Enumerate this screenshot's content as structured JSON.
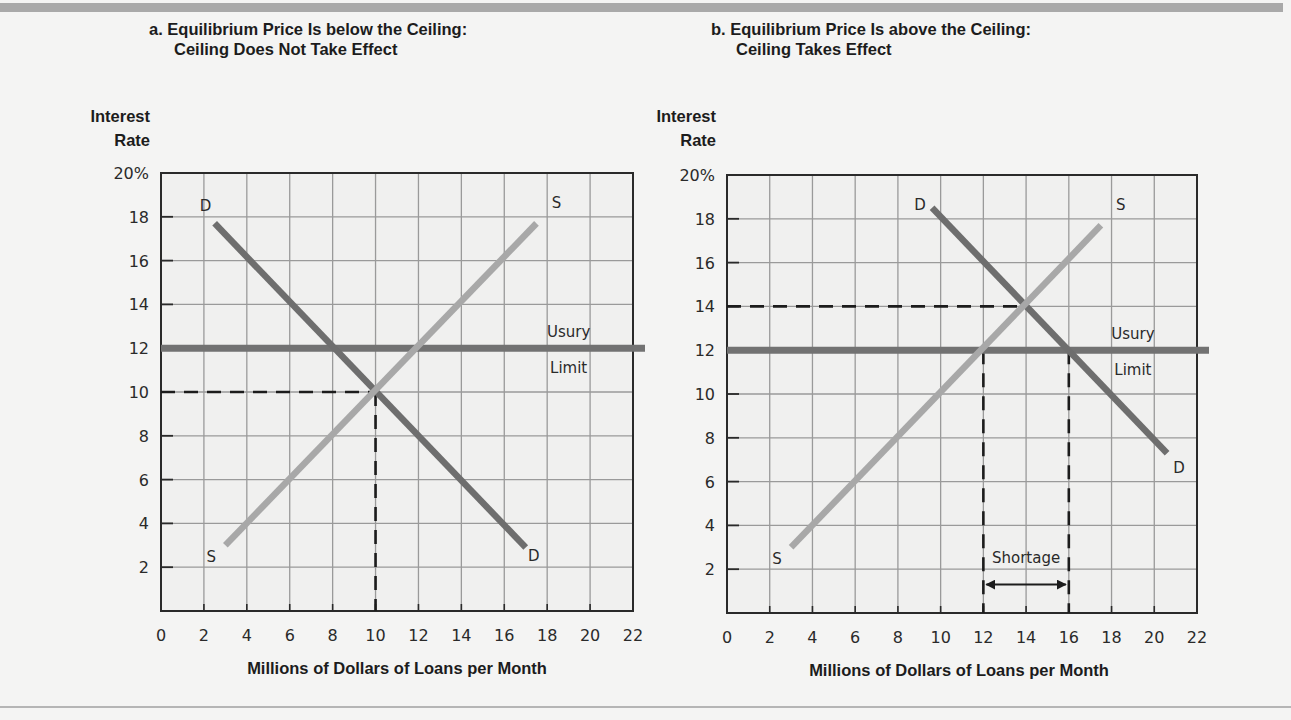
{
  "chart_data": [
    {
      "type": "line",
      "panel": "a",
      "title_line1": "a. Equilibrium Price Is below the Ceiling:",
      "title_line2": "Ceiling Does Not Take Effect",
      "ylabel_line1": "Interest",
      "ylabel_line2": "Rate",
      "xlabel": "Millions of Dollars of Loans per Month",
      "xlim": [
        0,
        22
      ],
      "ylim": [
        0,
        20
      ],
      "x_ticks": [
        0,
        2,
        4,
        6,
        8,
        10,
        12,
        14,
        16,
        18,
        20,
        22
      ],
      "x_tick_labels": [
        "0",
        "2",
        "4",
        "6",
        "8",
        "10",
        "12",
        "14",
        "16",
        "18",
        "20",
        "22"
      ],
      "y_ticks": [
        2,
        4,
        6,
        8,
        10,
        12,
        14,
        16,
        18,
        20
      ],
      "y_tick_labels": [
        "2",
        "4",
        "6",
        "8",
        "10",
        "12",
        "14",
        "16",
        "18",
        "20%"
      ],
      "grid": true,
      "series": [
        {
          "name": "Demand",
          "label_start": "D",
          "label_end": "D",
          "color": "#6e6e6e",
          "points": [
            [
              2.5,
              17.7
            ],
            [
              17.0,
              2.9
            ]
          ]
        },
        {
          "name": "Supply",
          "label_start": "S",
          "label_end": "S",
          "color": "#a8a8a8",
          "points": [
            [
              3.0,
              3.0
            ],
            [
              17.5,
              17.7
            ]
          ]
        }
      ],
      "ceiling": {
        "value": 12,
        "label_line1": "Usury",
        "label_line2": "Limit",
        "color": "#727272"
      },
      "equilibrium": {
        "x": 10,
        "y": 10
      },
      "annotations": []
    },
    {
      "type": "line",
      "panel": "b",
      "title_line1": "b. Equilibrium Price Is above the Ceiling:",
      "title_line2": "Ceiling Takes Effect",
      "ylabel_line1": "Interest",
      "ylabel_line2": "Rate",
      "xlabel": "Millions of Dollars of Loans per Month",
      "xlim": [
        0,
        22
      ],
      "ylim": [
        0,
        20
      ],
      "x_ticks": [
        0,
        2,
        4,
        6,
        8,
        10,
        12,
        14,
        16,
        18,
        20,
        22
      ],
      "x_tick_labels": [
        "0",
        "2",
        "4",
        "6",
        "8",
        "10",
        "12",
        "14",
        "16",
        "18",
        "20",
        "22"
      ],
      "y_ticks": [
        2,
        4,
        6,
        8,
        10,
        12,
        14,
        16,
        18,
        20
      ],
      "y_tick_labels": [
        "2",
        "4",
        "6",
        "8",
        "10",
        "12",
        "14",
        "16",
        "18",
        "20%"
      ],
      "grid": true,
      "series": [
        {
          "name": "Demand",
          "label_start": "D",
          "label_end": "D",
          "color": "#6e6e6e",
          "points": [
            [
              9.6,
              18.5
            ],
            [
              20.6,
              7.3
            ]
          ]
        },
        {
          "name": "Supply",
          "label_start": "S",
          "label_end": "S",
          "color": "#a8a8a8",
          "points": [
            [
              3.0,
              3.0
            ],
            [
              17.5,
              17.7
            ]
          ]
        }
      ],
      "ceiling": {
        "value": 12,
        "label_line1": "Usury",
        "label_line2": "Limit",
        "color": "#727272"
      },
      "equilibrium": {
        "x": 14,
        "y": 14
      },
      "quantity_supplied_at_ceiling": 12,
      "quantity_demanded_at_ceiling": 16,
      "annotations": [
        {
          "text": "Shortage",
          "from_x": 12,
          "to_x": 16,
          "y": 1.8
        }
      ]
    }
  ]
}
